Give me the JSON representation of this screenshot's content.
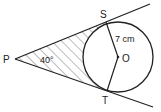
{
  "diagram": {
    "points": {
      "P": {
        "label": "P",
        "x": 15,
        "y": 59
      },
      "S": {
        "label": "S",
        "x": 106,
        "y": 22
      },
      "T": {
        "label": "T",
        "x": 107,
        "y": 91
      },
      "O": {
        "label": "O",
        "x": 118,
        "y": 57
      }
    },
    "circle": {
      "center": "O",
      "radius_px": 35
    },
    "radius_label": "7 cm",
    "angle_label": "40°",
    "shaded_region": "region bounded by PS, PT and minor arc ST",
    "stroke_color": "#222222",
    "hatch_color": "#555555"
  }
}
